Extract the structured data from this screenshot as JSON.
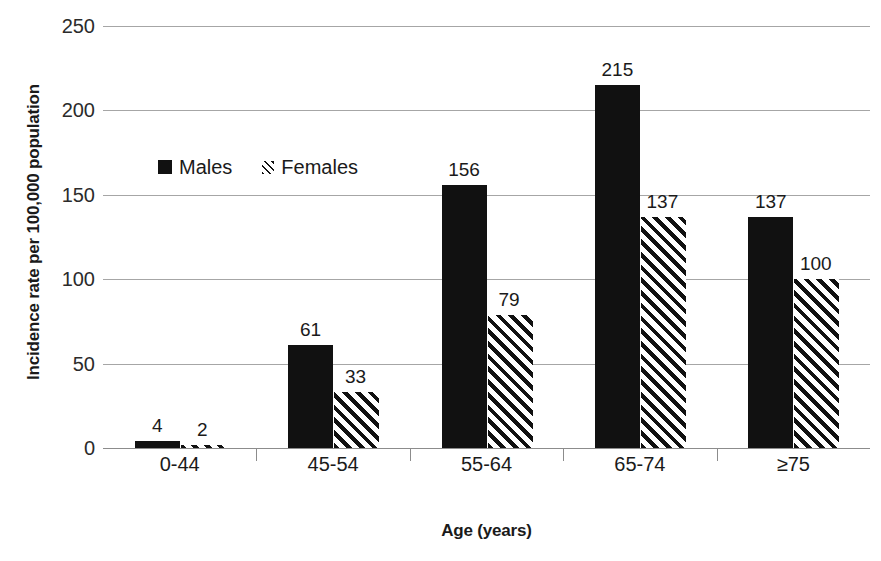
{
  "chart_data": {
    "type": "bar",
    "title": "",
    "xlabel": "Age (years)",
    "ylabel": "Incidence rate per 100,000 population",
    "categories": [
      "0-44",
      "45-54",
      "55-64",
      "65-74",
      "≥75"
    ],
    "series": [
      {
        "name": "Males",
        "values": [
          4,
          61,
          156,
          215,
          137
        ],
        "pattern": "solid",
        "color": "#111111"
      },
      {
        "name": "Females",
        "values": [
          2,
          33,
          79,
          137,
          100
        ],
        "pattern": "diagonal-hatch",
        "color": "#111111"
      }
    ],
    "ylim": [
      0,
      250
    ],
    "yticks": [
      0,
      50,
      100,
      150,
      200,
      250
    ],
    "ytick_labels": [
      "0",
      "50",
      "100",
      "150",
      "200",
      "250"
    ],
    "grid": true,
    "grid_axis": "y",
    "legend_position": "inside-upper-left",
    "data_labels": true
  },
  "legend": {
    "items": [
      {
        "label": "Males",
        "swatch": "solid-square-swatch"
      },
      {
        "label": "Females",
        "swatch": "hatched-square-swatch"
      }
    ]
  }
}
